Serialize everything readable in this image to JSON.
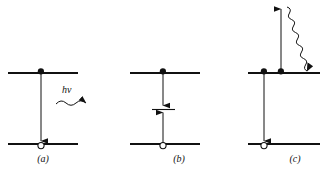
{
  "figure": {
    "background_color": "#ffffff",
    "ink_color": "#111111",
    "width": 328,
    "height": 175,
    "panels": [
      {
        "id": "a",
        "caption": "(a)",
        "description": "radiative recombination",
        "upper_level": {
          "x1": 8,
          "x2": 78,
          "y": 73
        },
        "lower_level": {
          "x1": 8,
          "x2": 78,
          "y": 144
        },
        "electron_marker": {
          "x": 41,
          "y": 71,
          "type": "filled-dot"
        },
        "hole_marker": {
          "x": 41,
          "y": 146,
          "type": "open-circle"
        },
        "transition_arrow": {
          "x": 41,
          "y1": 73,
          "y2": 142,
          "direction": "down"
        },
        "photon_label": "hν",
        "photon_wave": {
          "x1": 56,
          "x2": 96,
          "y": 103,
          "direction": "right"
        }
      },
      {
        "id": "b",
        "caption": "(b)",
        "description": "recombination via an intermediate trap level",
        "upper_level": {
          "x1": 130,
          "x2": 200,
          "y": 73
        },
        "lower_level": {
          "x1": 130,
          "x2": 200,
          "y": 144
        },
        "electron_marker": {
          "x": 163,
          "y": 71,
          "type": "filled-dot"
        },
        "hole_marker": {
          "x": 163,
          "y": 146,
          "type": "open-circle"
        },
        "trap_level": {
          "x1": 152,
          "x2": 174,
          "y": 109
        },
        "arrow_down_to_trap": {
          "x": 163,
          "y1": 73,
          "y2": 106,
          "direction": "down"
        },
        "arrow_up_to_trap": {
          "x": 163,
          "y1": 144,
          "y2": 112,
          "direction": "up"
        }
      },
      {
        "id": "c",
        "caption": "(c)",
        "description": "Auger recombination with carrier excitation and relaxation",
        "upper_level": {
          "x1": 248,
          "x2": 320,
          "y": 73
        },
        "lower_level": {
          "x1": 248,
          "x2": 320,
          "y": 144
        },
        "electron_markers": [
          {
            "x": 264,
            "y": 71,
            "type": "filled-dot"
          },
          {
            "x": 281,
            "y": 71,
            "type": "filled-dot"
          }
        ],
        "hole_marker": {
          "x": 264,
          "y": 146,
          "type": "open-circle"
        },
        "excitation_arrow": {
          "x": 281,
          "y1": 73,
          "y2": 8,
          "direction": "up"
        },
        "recombination_arrow": {
          "x": 264,
          "y1": 73,
          "y2": 142,
          "direction": "down"
        },
        "relaxation_wave": {
          "x1": 288,
          "y1": 12,
          "x2": 313,
          "y2": 70,
          "direction": "down-right"
        }
      }
    ]
  }
}
